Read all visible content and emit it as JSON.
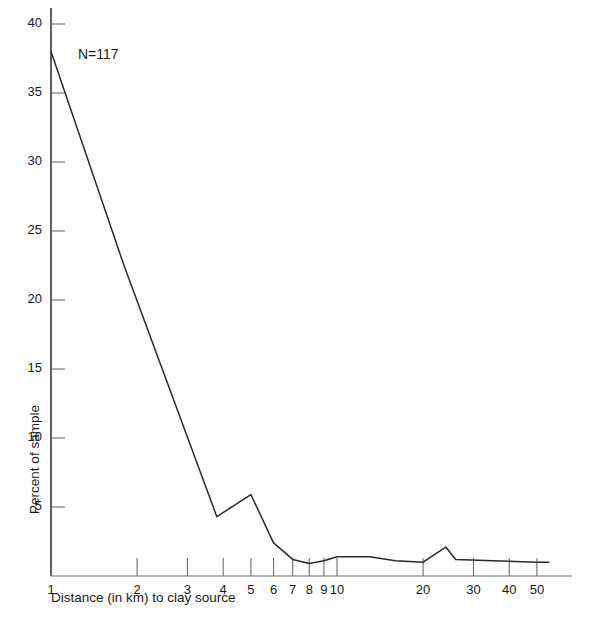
{
  "chart_data": {
    "type": "line",
    "title": "",
    "xlabel": "Distance (in km) to clay source",
    "ylabel": "Percent of sample",
    "annotation": "N=117",
    "xscale": "log",
    "xlim": [
      1,
      60
    ],
    "ylim": [
      0,
      41
    ],
    "grid": false,
    "legend": null,
    "y_ticks": [
      5,
      10,
      15,
      20,
      25,
      30,
      35,
      40
    ],
    "y_tick_labels": [
      "5",
      "10",
      "15",
      "20",
      "25",
      "30",
      "35",
      "40"
    ],
    "x_ticks": [
      1,
      2,
      3,
      4,
      5,
      6,
      7,
      8,
      9,
      10,
      20,
      30,
      40,
      50
    ],
    "x_tick_labels": [
      "1",
      "2",
      "3",
      "4",
      "5",
      "6",
      "7",
      "8",
      "9",
      "10",
      "20",
      "30",
      "40",
      "50"
    ],
    "series": [
      {
        "name": "Percent of sample",
        "x": [
          1,
          1.8,
          3.8,
          5,
          6,
          7,
          8,
          9,
          10,
          13,
          16,
          20,
          24,
          26,
          35,
          50,
          55
        ],
        "values": [
          38.0,
          22.5,
          4.3,
          5.9,
          2.4,
          1.2,
          0.9,
          1.1,
          1.4,
          1.4,
          1.1,
          1.0,
          2.1,
          1.2,
          1.1,
          1.0,
          1.0
        ]
      }
    ]
  }
}
